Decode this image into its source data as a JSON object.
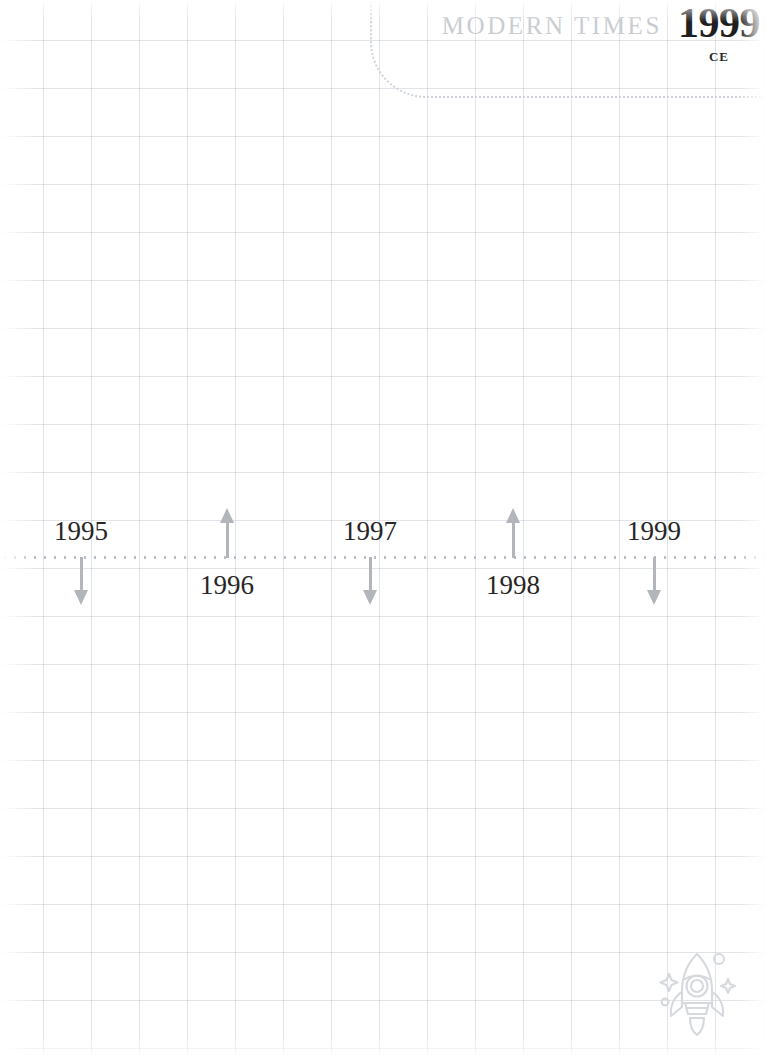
{
  "page": {
    "background_color": "#ffffff",
    "grid_color": "#b0b8c4",
    "width": 766,
    "height": 1056
  },
  "header": {
    "era_label": "MODERN TIMES",
    "era_year": "1999",
    "era_suffix": "CE",
    "era_label_color": "#c9ccd1",
    "era_year_color": "#1f1f1f",
    "border_color": "#cfd4da"
  },
  "timeline": {
    "axis_color": "#b9bec6",
    "axis_style": "dotted",
    "marker_color": "#b2b6bb",
    "label_color": "#262626",
    "markers": [
      {
        "label": "1995",
        "x": 81,
        "direction": "down"
      },
      {
        "label": "1996",
        "x": 227,
        "direction": "up"
      },
      {
        "label": "1997",
        "x": 370,
        "direction": "down"
      },
      {
        "label": "1998",
        "x": 513,
        "direction": "up"
      },
      {
        "label": "1999",
        "x": 654,
        "direction": "down"
      }
    ]
  },
  "decoration": {
    "icon": "rocket-icon",
    "icon_color": "#d6d9dd"
  }
}
